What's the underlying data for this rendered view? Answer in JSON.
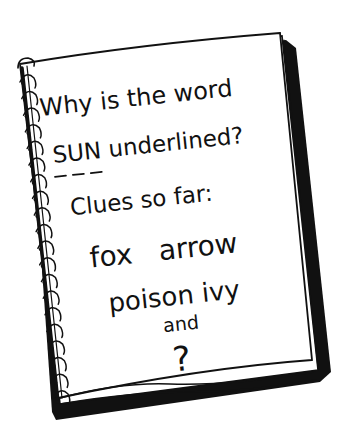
{
  "illustration": {
    "subject": "spiral-notebook",
    "ink_color": "#111111",
    "paper_color": "#ffffff"
  },
  "notebook": {
    "lines": [
      "Why is the word",
      "SUN underlined?",
      "Clues so far:",
      "fox   arrow",
      "poison ivy",
      "and",
      "?"
    ],
    "underlined_word": "SUN",
    "underline_style": "dashed"
  }
}
